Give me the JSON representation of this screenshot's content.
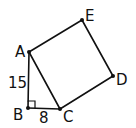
{
  "diagram": {
    "type": "geometry",
    "points": {
      "A": {
        "label": "A",
        "x": 29,
        "y": 52
      },
      "B": {
        "label": "B",
        "x": 28,
        "y": 108
      },
      "C": {
        "label": "C",
        "x": 60,
        "y": 109
      },
      "D": {
        "label": "D",
        "x": 113,
        "y": 76
      },
      "E": {
        "label": "E",
        "x": 82,
        "y": 20
      }
    },
    "segments": [
      {
        "from": "A",
        "to": "B",
        "length_label": "15"
      },
      {
        "from": "B",
        "to": "C",
        "length_label": "8"
      },
      {
        "from": "A",
        "to": "C"
      },
      {
        "from": "C",
        "to": "D"
      },
      {
        "from": "D",
        "to": "E"
      },
      {
        "from": "E",
        "to": "A"
      }
    ],
    "right_angle_at": "B",
    "labels": {
      "A": "A",
      "B": "B",
      "C": "C",
      "D": "D",
      "E": "E",
      "AB": "15",
      "BC": "8"
    },
    "colors": {
      "stroke": "#111111",
      "background": "#ffffff"
    }
  }
}
